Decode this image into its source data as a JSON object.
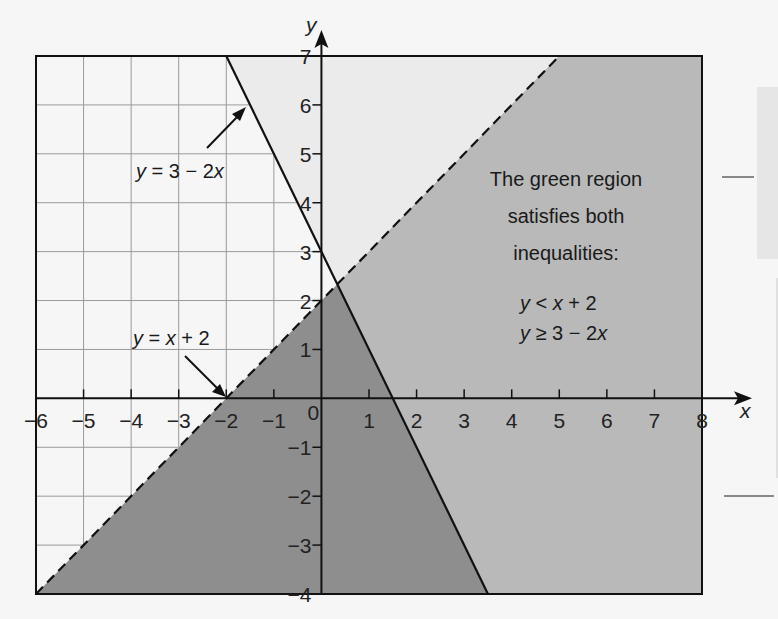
{
  "chart_data": {
    "type": "area",
    "title": "",
    "xlabel": "x",
    "ylabel": "y",
    "xlim": [
      -6,
      8
    ],
    "ylim": [
      -4,
      7
    ],
    "grid": true,
    "x_ticks": [
      -6,
      -5,
      -4,
      -3,
      -2,
      -1,
      0,
      1,
      2,
      3,
      4,
      5,
      6,
      7,
      8
    ],
    "x_tick_labels": [
      "−6",
      "−5",
      "−4",
      "−3",
      "−2",
      "−1",
      "0",
      "1",
      "2",
      "3",
      "4",
      "5",
      "6",
      "7",
      "8"
    ],
    "y_ticks": [
      -4,
      -3,
      -2,
      -1,
      1,
      2,
      3,
      4,
      5,
      6,
      7
    ],
    "y_tick_labels": [
      "−4",
      "−3",
      "−2",
      "−1",
      "1",
      "2",
      "3",
      "4",
      "5",
      "6",
      "7"
    ],
    "lines": [
      {
        "name": "y = 3 − 2x",
        "slope": -2,
        "intercept": 3,
        "style": "solid",
        "label_parts": [
          "y",
          " = 3 − 2",
          "x"
        ]
      },
      {
        "name": "y = x + 2",
        "slope": 1,
        "intercept": 2,
        "style": "dashed",
        "label_parts": [
          "y",
          " = ",
          "x",
          " + 2"
        ]
      }
    ],
    "regions": [
      {
        "name": "y ≥ 3 − 2x",
        "color": "#ebebeb"
      },
      {
        "name": "y < x + 2",
        "color": "#8e8e8e"
      },
      {
        "name": "both inequalities",
        "color": "#b9b9b9"
      }
    ],
    "annotation": {
      "lines": [
        "The green region",
        "satisfies both",
        "inequalities:"
      ],
      "inequalities": [
        {
          "parts": [
            "y",
            " < ",
            "x",
            " + 2"
          ]
        },
        {
          "parts": [
            "y",
            " ≥ 3 − 2",
            "x"
          ]
        }
      ]
    },
    "intersection": {
      "x": 0.333,
      "y": 2.333
    }
  },
  "colors": {
    "background": "#f6f6f6",
    "grid": "#9a9a9a",
    "axis": "#111111"
  }
}
